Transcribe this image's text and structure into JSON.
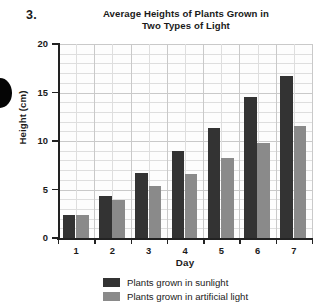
{
  "problem": {
    "number": "3."
  },
  "chart_data": {
    "type": "bar",
    "title": "Average Heights of Plants Grown in Two Types of Light",
    "title_line_1": "Average Heights of Plants Grown in",
    "title_line_2": "Two Types of Light",
    "xlabel": "Day",
    "ylabel": "Height (cm)",
    "categories": [
      "1",
      "2",
      "3",
      "4",
      "5",
      "6",
      "7"
    ],
    "ylim": [
      0,
      20
    ],
    "ytick_labels": [
      "0",
      "5",
      "10",
      "15",
      "20"
    ],
    "ytick_values": [
      0,
      5,
      10,
      15,
      20
    ],
    "y_minor_step": 1,
    "grid": true,
    "legend_position": "bottom",
    "series": [
      {
        "name": "Plants grown in sunlight",
        "color": "#333333",
        "values": [
          2.4,
          4.3,
          6.7,
          9.0,
          11.3,
          14.5,
          16.7
        ]
      },
      {
        "name": "Plants grown in artificial light",
        "color": "#8a8a8a",
        "values": [
          2.4,
          3.9,
          5.4,
          6.6,
          8.2,
          9.8,
          11.5
        ]
      }
    ]
  }
}
